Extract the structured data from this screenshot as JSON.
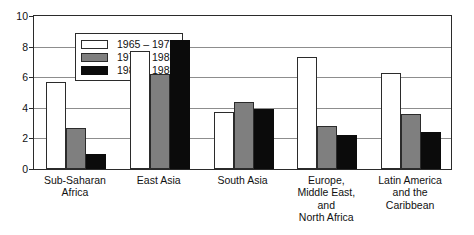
{
  "chart_data": {
    "type": "bar",
    "title": "",
    "subtitle": "",
    "xlabel": "",
    "ylabel": "",
    "ylim": [
      0,
      10
    ],
    "yticks": [
      0,
      2,
      4,
      6,
      8,
      10
    ],
    "ytick_labels": [
      "0",
      "2",
      "4",
      "6",
      "8",
      "10"
    ],
    "grid": true,
    "grid_axis": "y",
    "legend_position": "top-left inside plot",
    "categories": [
      "Sub-Saharan\nAfrica",
      "East Asia",
      "South Asia",
      "Europe,\nMiddle East,\nand\nNorth Africa",
      "Latin America\nand the\nCaribbean"
    ],
    "series": [
      {
        "name": "1965 – 1973",
        "color": "#ffffff",
        "values": [
          5.7,
          7.7,
          3.7,
          7.3,
          6.3
        ]
      },
      {
        "name": "1973 – 1982",
        "color": "#7f7f7f",
        "values": [
          2.7,
          6.2,
          4.35,
          2.8,
          3.6
        ]
      },
      {
        "name": "1982 – 1988",
        "color": "#0b0b0b",
        "values": [
          1.0,
          8.4,
          3.9,
          2.2,
          2.4
        ]
      }
    ]
  },
  "legend": {
    "items": [
      {
        "label": "1965 – 1973",
        "swatch": "white-swatch"
      },
      {
        "label": "1973 – 1982",
        "swatch": "gray-swatch"
      },
      {
        "label": "1982 – 1988",
        "swatch": "black-swatch"
      }
    ]
  },
  "axis": {
    "y_tick_labels": [
      "10",
      "8",
      "6",
      "4",
      "2",
      "0"
    ]
  },
  "colors": {
    "series_1": "#ffffff",
    "series_2": "#7f7f7f",
    "series_3": "#0b0b0b",
    "frame": "#2b2b2b",
    "gridline": "#8d8d8d",
    "background": "#ffffff"
  }
}
